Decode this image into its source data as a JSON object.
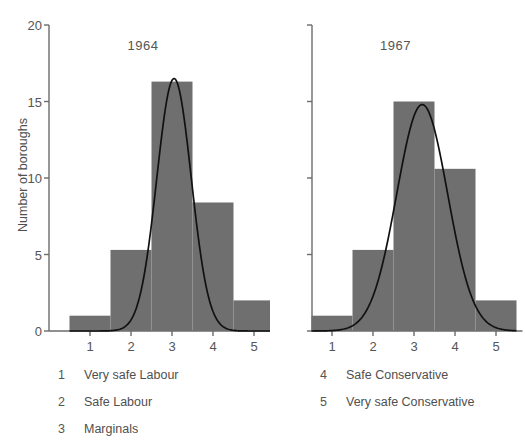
{
  "chart_data": [
    {
      "type": "bar",
      "title": "1964",
      "categories": [
        "1",
        "2",
        "3",
        "4",
        "5"
      ],
      "values": [
        1,
        5.3,
        16.3,
        8.4,
        2
      ],
      "xlabel": "",
      "ylabel": "Number of boroughs",
      "ylim": [
        0,
        20
      ],
      "yticks": [
        0,
        5,
        10,
        15,
        20
      ],
      "xticks": [
        1,
        2,
        3,
        4,
        5
      ],
      "grid": false,
      "legend_position": "below",
      "overlay": {
        "type": "line",
        "name": "fitted normal curve",
        "peak_x": 3.05,
        "peak_y": 16.5,
        "sigma": 0.42
      },
      "bar_color": "#706f6f",
      "curve_color": "#111111"
    },
    {
      "type": "bar",
      "title": "1967",
      "categories": [
        "1",
        "2",
        "3",
        "4",
        "5"
      ],
      "values": [
        1,
        5.3,
        15,
        10.6,
        2
      ],
      "xlabel": "",
      "ylabel": "Number of boroughs",
      "ylim": [
        0,
        20
      ],
      "yticks": [
        0,
        5,
        10,
        15,
        20
      ],
      "xticks": [
        1,
        2,
        3,
        4,
        5
      ],
      "grid": false,
      "legend_position": "below",
      "overlay": {
        "type": "line",
        "name": "fitted normal curve",
        "peak_x": 3.2,
        "peak_y": 14.8,
        "sigma": 0.62
      },
      "bar_color": "#706f6f",
      "curve_color": "#111111"
    }
  ],
  "axes": {
    "ylabel": "Number of boroughs",
    "ytick_labels": [
      "20",
      "15",
      "10",
      "5",
      "0"
    ],
    "xtick_labels": [
      "1",
      "2",
      "3",
      "4",
      "5"
    ]
  },
  "panels": {
    "left_title": "1964",
    "right_title": "1967"
  },
  "legend": {
    "left_column": [
      {
        "key": "1",
        "text": "Very safe Labour"
      },
      {
        "key": "2",
        "text": "Safe Labour"
      },
      {
        "key": "3",
        "text": "Marginals"
      }
    ],
    "right_column": [
      {
        "key": "4",
        "text": "Safe Conservative"
      },
      {
        "key": "5",
        "text": "Very safe Conservative"
      }
    ]
  },
  "colors": {
    "bar_fill": "#706f6f",
    "curve": "#111111",
    "axis": "#6b6b6b",
    "text": "#555555"
  }
}
